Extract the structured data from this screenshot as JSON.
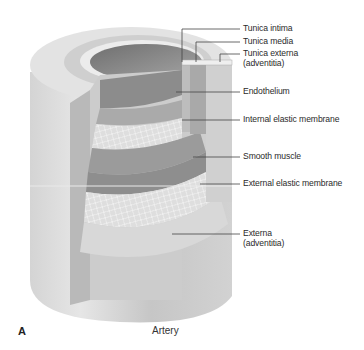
{
  "figure": {
    "panel_letter": "A",
    "caption": "Artery",
    "labels": {
      "tunica_intima": "Tunica intima",
      "tunica_media": "Tunica media",
      "tunica_externa_line1": "Tunica externa",
      "tunica_externa_line2": "(adventitia)",
      "endothelium": "Endothelium",
      "internal_elastic_membrane": "Internal elastic membrane",
      "smooth_muscle": "Smooth muscle",
      "external_elastic_membrane": "External elastic membrane",
      "externa_line1": "Externa",
      "externa_line2": "(adventitia)"
    },
    "colors": {
      "outer_wall": "#c9c9c9",
      "lumen": "#8a8a8a",
      "smooth_muscle": "#9a9a9a",
      "elastic_mesh": "#dcdcdc",
      "leader_line": "#444444"
    }
  }
}
